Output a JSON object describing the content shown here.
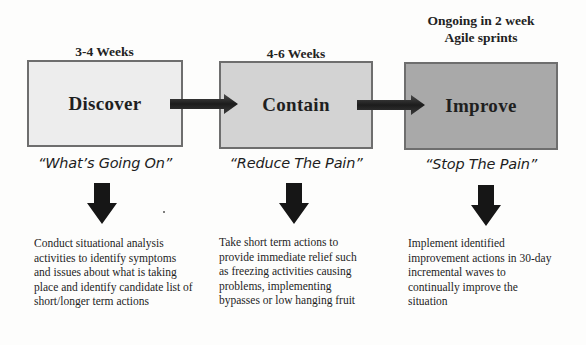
{
  "diagram": {
    "colors": {
      "background": "#fdfdfc",
      "box_border": "#6e6e6e",
      "discover_fill": "#ededed",
      "contain_fill": "#d3d3d3",
      "improve_fill": "#a9a9a9",
      "arrow": "#1a1a1a"
    },
    "phases": [
      {
        "duration": "3-4 Weeks",
        "name": "Discover",
        "tagline": "“What’s Going On”",
        "description": "Conduct situational analysis activities to identify symptoms and issues about what is taking place and identify candidate list of short/longer term actions"
      },
      {
        "duration": "4-6 Weeks",
        "name": "Contain",
        "tagline": "“Reduce The Pain”",
        "description": "Take short term actions to provide immediate relief such as freezing activities causing problems, implementing bypasses or low hanging fruit"
      },
      {
        "duration_line1": "Ongoing in 2 week",
        "duration_line2": "Agile sprints",
        "name": "Improve",
        "tagline": "“Stop The Pain”",
        "description": "Implement identified improvement actions in 30-day incremental waves  to continually improve the situation"
      }
    ],
    "connectors": [
      {
        "from": "Discover",
        "to": "Contain",
        "icon": "right-arrow-icon"
      },
      {
        "from": "Contain",
        "to": "Improve",
        "icon": "right-arrow-icon"
      }
    ],
    "down_arrows": [
      "down-arrow-icon",
      "down-arrow-icon",
      "down-arrow-icon"
    ]
  }
}
